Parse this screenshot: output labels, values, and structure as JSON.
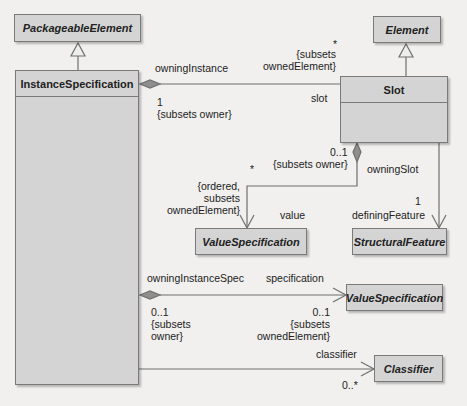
{
  "classes": {
    "packageable_element": "PackageableElement",
    "instance_specification": "InstanceSpecification",
    "element": "Element",
    "slot": "Slot",
    "value_specification_1": "ValueSpecification",
    "structural_feature": "StructuralFeature",
    "value_specification_2": "ValueSpecification",
    "classifier": "Classifier"
  },
  "associations": {
    "owning_instance": {
      "role": "owningInstance",
      "mult_owner": "1",
      "constraint_owner": "{subsets owner}",
      "mult_slot": "*",
      "constraint_slot_1": "{subsets",
      "constraint_slot_2": "ownedElement}",
      "role_slot": "slot"
    },
    "owning_slot": {
      "mult": "0..1",
      "constraint": "{subsets owner}",
      "role": "owningSlot",
      "value_mult": "*",
      "value_constraint_1": "{ordered,",
      "value_constraint_2": "subsets",
      "value_constraint_3": "ownedElement}",
      "value_role": "value"
    },
    "defining_feature": {
      "mult": "1",
      "role": "definingFeature"
    },
    "owning_instance_spec": {
      "role": "owningInstanceSpec",
      "mult": "0..1",
      "constraint_1": "{subsets",
      "constraint_2": "owner}",
      "spec_role": "specification",
      "spec_mult": "0..1",
      "spec_constraint_1": "{subsets",
      "spec_constraint_2": "ownedElement}"
    },
    "classifier": {
      "role": "classifier",
      "mult": "0..*"
    }
  },
  "colors": {
    "class_fill": "#d4d4d4",
    "border": "#7a7a7a",
    "line": "#6f6f6f",
    "background": "#f1f0ee"
  }
}
